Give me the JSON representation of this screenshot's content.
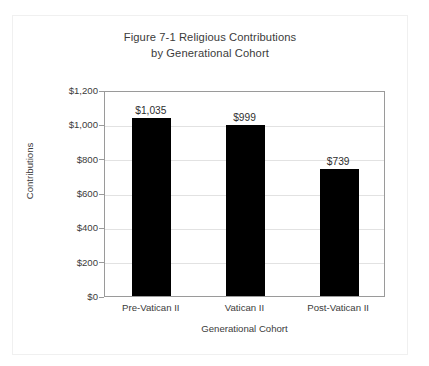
{
  "chart_data": {
    "type": "bar",
    "title": "Figure 7-1 Religious Contributions by Generational Cohort",
    "title_lines": [
      "Figure 7-1 Religious Contributions",
      "by Generational Cohort"
    ],
    "xlabel": "Generational Cohort",
    "ylabel": "Contributions",
    "categories": [
      "Pre-Vatican II",
      "Vatican II",
      "Post-Vatican II"
    ],
    "values": [
      1035,
      999,
      739
    ],
    "value_labels": [
      "$1,035",
      "$999",
      "$739"
    ],
    "ylim": [
      0,
      1200
    ],
    "ytick_values": [
      0,
      200,
      400,
      600,
      800,
      1000,
      1200
    ],
    "ytick_labels": [
      "$0",
      "$200",
      "$400",
      "$600",
      "$800",
      "$1,000",
      "$1,200"
    ],
    "grid": "horizontal",
    "legend": "none",
    "bar_color": "#000000",
    "gridline_color": "#e2e2e2",
    "axis_color": "#9a9a9a",
    "text_color": "#3b3b3b",
    "background_color": "#ffffff"
  }
}
